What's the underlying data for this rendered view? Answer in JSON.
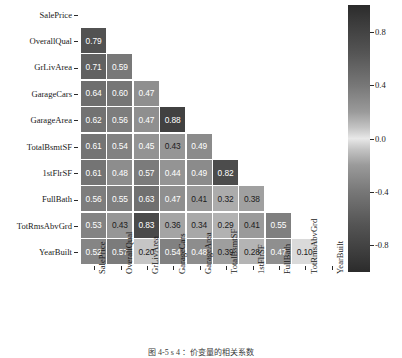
{
  "chart_data": {
    "type": "heatmap",
    "title": "",
    "xlabel": "",
    "ylabel": "",
    "legend_position": "right",
    "grid": false,
    "mask": "lower-triangle",
    "variables": [
      "SalePrice",
      "OverallQual",
      "GrLivArea",
      "GarageCars",
      "GarageArea",
      "TotalBsmtSF",
      "1stFlrSF",
      "FullBath",
      "TotRmsAbvGrd",
      "YearBuilt"
    ],
    "x_tick_labels": [
      "SalePrice",
      "OverallQual",
      "GrLivArea",
      "GarageCars",
      "GarageArea",
      "TotalBsmtSF",
      "1stFlrSF",
      "FullBath",
      "TotRmsAbvGrd",
      "YearBuilt"
    ],
    "y_tick_labels": [
      "SalePrice",
      "OverallQual",
      "GrLivArea",
      "GarageCars",
      "GarageArea",
      "TotalBsmtSF",
      "1stFlrSF",
      "FullBath",
      "TotRmsAbvGrd",
      "YearBuilt"
    ],
    "colorbar": {
      "ticks": [
        0.8,
        0.4,
        0.0,
        -0.4,
        -0.8
      ],
      "tick_labels": [
        "0.8",
        "0.4",
        "0.0",
        "-0.4",
        "-0.8"
      ],
      "vmin": -1.0,
      "vmax": 1.0,
      "colormap": "diverging-gray"
    },
    "annotated": true,
    "rows": [
      {
        "label": "SalePrice",
        "cells": []
      },
      {
        "label": "OverallQual",
        "cells": [
          0.79
        ]
      },
      {
        "label": "GrLivArea",
        "cells": [
          0.71,
          0.59
        ]
      },
      {
        "label": "GarageCars",
        "cells": [
          0.64,
          0.6,
          0.47
        ]
      },
      {
        "label": "GarageArea",
        "cells": [
          0.62,
          0.56,
          0.47,
          0.88
        ]
      },
      {
        "label": "TotalBsmtSF",
        "cells": [
          0.61,
          0.54,
          0.45,
          0.43,
          0.49
        ]
      },
      {
        "label": "1stFlrSF",
        "cells": [
          0.61,
          0.48,
          0.57,
          0.44,
          0.49,
          0.82
        ]
      },
      {
        "label": "FullBath",
        "cells": [
          0.56,
          0.55,
          0.63,
          0.47,
          0.41,
          0.32,
          0.38
        ]
      },
      {
        "label": "TotRmsAbvGrd",
        "cells": [
          0.53,
          0.43,
          0.83,
          0.36,
          0.34,
          0.29,
          0.41,
          0.55
        ]
      },
      {
        "label": "YearBuilt",
        "cells": [
          0.52,
          0.57,
          0.2,
          0.54,
          0.48,
          0.39,
          0.28,
          0.47,
          0.1
        ]
      }
    ],
    "cell_labels": [
      [],
      [
        "0.79"
      ],
      [
        "0.71",
        "0.59"
      ],
      [
        "0.64",
        "0.60",
        "0.47"
      ],
      [
        "0.62",
        "0.56",
        "0.47",
        "0.88"
      ],
      [
        "0.61",
        "0.54",
        "0.45",
        "0.43",
        "0.49"
      ],
      [
        "0.61",
        "0.48",
        "0.57",
        "0.44",
        "0.49",
        "0.82"
      ],
      [
        "0.56",
        "0.55",
        "0.63",
        "0.47",
        "0.41",
        "0.32",
        "0.38"
      ],
      [
        "0.53",
        "0.43",
        "0.83",
        "0.36",
        "0.34",
        "0.29",
        "0.41",
        "0.55"
      ],
      [
        "0.52",
        "0.57",
        "0.20",
        "0.54",
        "0.48",
        "0.39",
        "0.28",
        "0.47",
        "0.10"
      ]
    ]
  },
  "caption": {
    "text": "图 4-5  s 4 ：价变量的相关系数"
  },
  "colors": {
    "background": "#ffffff",
    "text": "#1a1a1a",
    "cell_text_light": "#ffffff",
    "cell_text_dark": "#202020",
    "cmap_extreme": "#2b2b2b",
    "cmap_center": "#f0f0f0"
  }
}
